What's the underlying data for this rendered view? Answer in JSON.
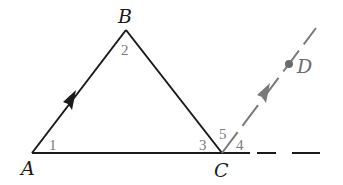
{
  "diagram": {
    "colors": {
      "triangle": "#1a1a1a",
      "auxiliary": "#7a7a7a",
      "angle_labels": "#7a7a7a"
    },
    "points": {
      "A": {
        "label": "A",
        "x": 32,
        "y": 153
      },
      "B": {
        "label": "B",
        "x": 126,
        "y": 30
      },
      "C": {
        "label": "C",
        "x": 222,
        "y": 153
      },
      "D": {
        "label": "D",
        "x": 289,
        "y": 64
      }
    },
    "angles": {
      "a1": "1",
      "a2": "2",
      "a3": "3",
      "a4": "4",
      "a5": "5"
    },
    "segments": [
      "AB",
      "BC",
      "AC"
    ],
    "auxiliary": [
      "CD (dashed ray parallel to AB)",
      "AC extended (dashed)"
    ]
  }
}
